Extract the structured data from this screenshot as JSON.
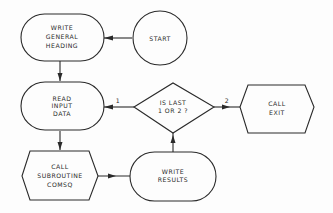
{
  "diagram": {
    "type": "flowchart",
    "nodes": {
      "start": {
        "lines": [
          "START"
        ],
        "shape": "circle"
      },
      "write_heading": {
        "lines": [
          "WRITE",
          "GENERAL",
          "HEADING"
        ],
        "shape": "rounded"
      },
      "read_input": {
        "lines": [
          "READ",
          "INPUT",
          "DATA"
        ],
        "shape": "rounded"
      },
      "decision": {
        "lines": [
          "IS LAST",
          "1 OR 2 ?"
        ],
        "shape": "diamond"
      },
      "call_exit": {
        "lines": [
          "CALL",
          "EXIT"
        ],
        "shape": "hexagon"
      },
      "call_subroutine": {
        "lines": [
          "CALL",
          "SUBROUTINE",
          "COMSQ"
        ],
        "shape": "hexagon"
      },
      "write_results": {
        "lines": [
          "WRITE",
          "RESULTS"
        ],
        "shape": "rounded"
      }
    },
    "edge_labels": {
      "decision_to_read": "1",
      "decision_to_exit": "2"
    },
    "edges": [
      {
        "from": "start",
        "to": "write_heading"
      },
      {
        "from": "write_heading",
        "to": "read_input"
      },
      {
        "from": "read_input",
        "to": "call_subroutine"
      },
      {
        "from": "call_subroutine",
        "to": "write_results"
      },
      {
        "from": "write_results",
        "to": "decision"
      },
      {
        "from": "decision",
        "to": "read_input",
        "label": "1"
      },
      {
        "from": "decision",
        "to": "call_exit",
        "label": "2"
      }
    ]
  }
}
